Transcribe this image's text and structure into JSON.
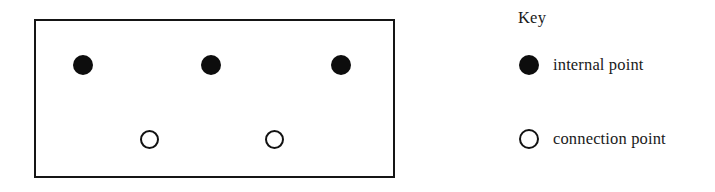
{
  "diagram": {
    "title": "",
    "region": {
      "shape": "rectangle",
      "stroke_color": "#151515",
      "fill_color": "#ffffff",
      "x": 34,
      "y": 19,
      "width": 361,
      "height": 159
    },
    "points": [
      {
        "type": "internal",
        "name": "internal-point-1",
        "cx": 83,
        "cy": 65
      },
      {
        "type": "internal",
        "name": "internal-point-2",
        "cx": 211,
        "cy": 65
      },
      {
        "type": "internal",
        "name": "internal-point-3",
        "cx": 341,
        "cy": 65
      },
      {
        "type": "connection",
        "name": "connection-point-1",
        "cx": 149,
        "cy": 139
      },
      {
        "type": "connection",
        "name": "connection-point-2",
        "cx": 274,
        "cy": 139
      }
    ],
    "counts": {
      "internal_points": 3,
      "connection_points": 2
    }
  },
  "key": {
    "title": "Key",
    "entries": [
      {
        "marker": "filled-circle",
        "label": "internal point",
        "color": "#0d0d0d"
      },
      {
        "marker": "hollow-circle",
        "label": "connection point",
        "color": "#121212"
      }
    ]
  }
}
